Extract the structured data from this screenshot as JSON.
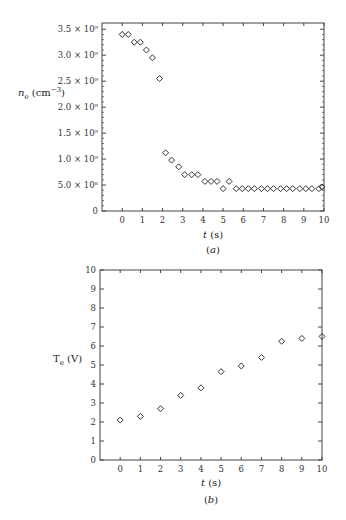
{
  "chart_data": [
    {
      "type": "scatter",
      "title": "",
      "caption": "(a)",
      "xlabel": "t (s)",
      "ylabel": "n_e (cm^-3)",
      "xlim": [
        -1,
        10
      ],
      "ylim": [
        0,
        3620000000.0
      ],
      "grid": false,
      "marker": "diamond",
      "xticks": [
        0,
        1,
        2,
        3,
        4,
        5,
        6,
        7,
        8,
        9,
        10
      ],
      "xtick_labels": [
        "0",
        "1",
        "2",
        "3",
        "4",
        "5",
        "6",
        "7",
        "8",
        "9",
        "10"
      ],
      "yticks": [
        0,
        500000000.0,
        1000000000.0,
        1500000000.0,
        2000000000.0,
        2500000000.0,
        3000000000.0,
        3500000000.0
      ],
      "ytick_labels": [
        "0",
        "5.0 × 10⁸",
        "1.0 × 10⁹",
        "1.5 × 10⁹",
        "2.0 × 10⁹",
        "2.5 × 10⁹",
        "3.0 × 10⁹",
        "3.5 × 10⁹"
      ],
      "x": [
        0.0,
        0.3,
        0.6,
        0.9,
        1.2,
        1.5,
        1.85,
        2.15,
        2.45,
        2.8,
        3.1,
        3.45,
        3.75,
        4.1,
        4.4,
        4.7,
        5.0,
        5.3,
        5.65,
        5.95,
        6.25,
        6.55,
        6.9,
        7.2,
        7.5,
        7.85,
        8.15,
        8.45,
        8.8,
        9.1,
        9.4,
        9.75,
        9.9
      ],
      "y": [
        3400000000.0,
        3400000000.0,
        3250000000.0,
        3250000000.0,
        3100000000.0,
        2950000000.0,
        2550000000.0,
        1120000000.0,
        980000000.0,
        850000000.0,
        700000000.0,
        700000000.0,
        700000000.0,
        570000000.0,
        570000000.0,
        570000000.0,
        430000000.0,
        570000000.0,
        430000000.0,
        430000000.0,
        430000000.0,
        430000000.0,
        430000000.0,
        430000000.0,
        430000000.0,
        430000000.0,
        430000000.0,
        430000000.0,
        430000000.0,
        430000000.0,
        430000000.0,
        430000000.0,
        460000000.0
      ]
    },
    {
      "type": "scatter",
      "title": "",
      "caption": "(b)",
      "xlabel": "t (s)",
      "ylabel": "T_e (V)",
      "xlim": [
        -1,
        10
      ],
      "ylim": [
        0,
        10
      ],
      "grid": false,
      "marker": "diamond",
      "xticks": [
        0,
        1,
        2,
        3,
        4,
        5,
        6,
        7,
        8,
        9,
        10
      ],
      "xtick_labels": [
        "0",
        "1",
        "2",
        "3",
        "4",
        "5",
        "6",
        "7",
        "8",
        "9",
        "10"
      ],
      "yticks": [
        0,
        1,
        2,
        3,
        4,
        5,
        6,
        7,
        8,
        9,
        10
      ],
      "ytick_labels": [
        "0",
        "1",
        "2",
        "3",
        "4",
        "5",
        "6",
        "7",
        "8",
        "9",
        "10"
      ],
      "x": [
        0,
        1,
        2,
        3,
        4,
        5,
        6,
        7,
        8,
        9,
        10
      ],
      "y": [
        2.1,
        2.3,
        2.7,
        3.4,
        3.8,
        4.65,
        4.95,
        5.4,
        6.25,
        6.4,
        6.5
      ]
    }
  ],
  "labels": {
    "a": {
      "ylabel_main": "n",
      "ylabel_sub": "e",
      "ylabel_unit": " (cm",
      "ylabel_exp": "−3",
      "ylabel_close": ")",
      "xlabel_var": "t",
      "xlabel_unit": " (s)",
      "caption_open": "(",
      "caption_letter": "a",
      "caption_close": ")"
    },
    "b": {
      "ylabel_main": "T",
      "ylabel_sub": "e",
      "ylabel_unit": " (V)",
      "xlabel_var": "t",
      "xlabel_unit": " (s)",
      "caption_open": "(",
      "caption_letter": "b",
      "caption_close": ")"
    }
  }
}
